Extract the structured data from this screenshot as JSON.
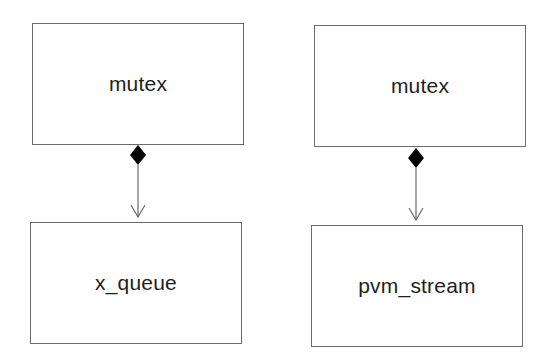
{
  "diagram": {
    "type": "uml-composition",
    "colors": {
      "line": "#6a6a6a",
      "diamond": "#000000",
      "text": "#1e1e1e",
      "background": "#ffffff"
    },
    "groups": [
      {
        "owner": {
          "label": "mutex"
        },
        "part": {
          "label": "x_queue"
        },
        "relation": "composition"
      },
      {
        "owner": {
          "label": "mutex"
        },
        "part": {
          "label": "pvm_stream"
        },
        "relation": "composition"
      }
    ]
  }
}
